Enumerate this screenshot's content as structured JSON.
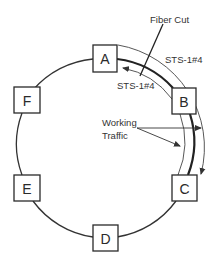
{
  "diagram": {
    "nodes": [
      {
        "id": "A",
        "label": "A"
      },
      {
        "id": "B",
        "label": "B"
      },
      {
        "id": "C",
        "label": "C"
      },
      {
        "id": "D",
        "label": "D"
      },
      {
        "id": "E",
        "label": "E"
      },
      {
        "id": "F",
        "label": "F"
      }
    ],
    "labels": {
      "fiber_cut": "Fiber Cut",
      "sts_outer": "STS-1#4",
      "sts_inner": "STS-1#4",
      "working_line1": "Working",
      "working_line2": "Traffic"
    },
    "colors": {
      "stroke": "#333333",
      "background": "#ffffff"
    }
  }
}
